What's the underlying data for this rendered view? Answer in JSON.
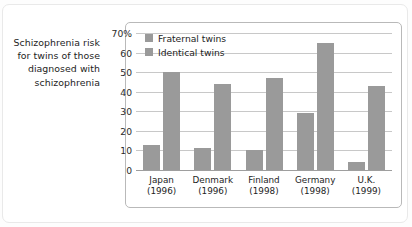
{
  "caption": "Schizophrenia risk for twins of those diagnosed with schizophrenia",
  "legend": {
    "items": [
      {
        "label": "Fraternal twins",
        "color": "#9a9a9a"
      },
      {
        "label": "Identical twins",
        "color": "#9a9a9a"
      }
    ]
  },
  "axis": {
    "yticks": [
      "0",
      "10",
      "20",
      "30",
      "40",
      "50",
      "60",
      "70%"
    ],
    "xlabels": [
      {
        "name": "Japan",
        "year": "(1996)"
      },
      {
        "name": "Denmark",
        "year": "(1996)"
      },
      {
        "name": "Finland",
        "year": "(1998)"
      },
      {
        "name": "Germany",
        "year": "(1998)"
      },
      {
        "name": "U.K.",
        "year": "(1999)"
      }
    ]
  },
  "chart_data": {
    "type": "bar",
    "title": "Schizophrenia risk for twins of those diagnosed with schizophrenia",
    "xlabel": "",
    "ylabel": "",
    "ylim": [
      0,
      70
    ],
    "yticks": [
      0,
      10,
      20,
      30,
      40,
      50,
      60,
      70
    ],
    "ytick_labels": [
      "0",
      "10",
      "20",
      "30",
      "40",
      "50",
      "60",
      "70%"
    ],
    "grid": true,
    "legend_position": "top-left inside plot",
    "categories": [
      "Japan (1996)",
      "Denmark (1996)",
      "Finland (1998)",
      "Germany (1998)",
      "U.K. (1999)"
    ],
    "category_names": [
      "Japan",
      "Denmark",
      "Finland",
      "Germany",
      "U.K."
    ],
    "category_years": [
      "1996",
      "1996",
      "1998",
      "1998",
      "1999"
    ],
    "series": [
      {
        "name": "Fraternal twins",
        "color": "#9a9a9a",
        "values": [
          13,
          11,
          10,
          29,
          4
        ]
      },
      {
        "name": "Identical twins",
        "color": "#9a9a9a",
        "values": [
          50,
          44,
          47,
          65,
          43
        ]
      }
    ],
    "units": "percent"
  }
}
